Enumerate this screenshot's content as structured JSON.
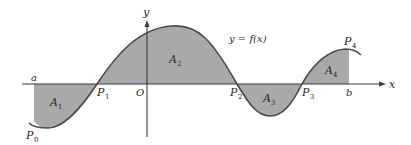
{
  "diagram": {
    "curve_label": "y = f(x)",
    "axes": {
      "x_label": "x",
      "y_label": "y",
      "origin_label": "O"
    },
    "bounds": {
      "left": "a",
      "right": "b"
    },
    "points": [
      {
        "name": "P",
        "sub": "0"
      },
      {
        "name": "P",
        "sub": "1"
      },
      {
        "name": "P",
        "sub": "2"
      },
      {
        "name": "P",
        "sub": "3"
      },
      {
        "name": "P",
        "sub": "4"
      }
    ],
    "regions": [
      {
        "name": "A",
        "sub": "1",
        "sign": "below"
      },
      {
        "name": "A",
        "sub": "2",
        "sign": "above"
      },
      {
        "name": "A",
        "sub": "3",
        "sign": "below"
      },
      {
        "name": "A",
        "sub": "4",
        "sign": "above"
      }
    ],
    "colors": {
      "fill": "#a9a9a9",
      "curve": "#4a4a4a",
      "axis": "#3a3a3a"
    }
  }
}
